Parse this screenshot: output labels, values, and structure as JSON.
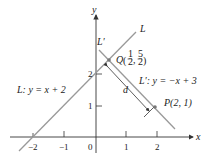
{
  "diagram": {
    "axes": {
      "x_label": "x",
      "y_label": "y",
      "x_ticks": [
        "−2",
        "−1",
        "0",
        "1",
        "2"
      ],
      "y_ticks": [
        "1",
        "2"
      ]
    },
    "lines": {
      "L": {
        "name": "L",
        "equation_label": "L: y = x + 2"
      },
      "L_prime": {
        "name": "L′",
        "equation_label": "L′: y = −x + 3"
      }
    },
    "points": {
      "Q": {
        "label": "Q",
        "x_num": "1",
        "x_den": "2",
        "y_num": "5",
        "y_den": "2"
      },
      "P": {
        "label": "P(2, 1)"
      }
    },
    "distance_label": "d",
    "colors": {
      "line": "#999999",
      "axis": "#333333",
      "text": "#222222"
    }
  }
}
